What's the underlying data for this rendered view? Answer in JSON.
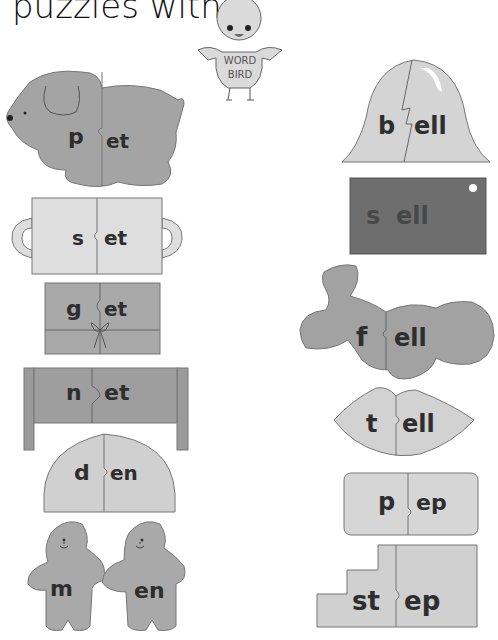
{
  "page": {
    "title": "puzzles with",
    "mascot": {
      "line1": "WORD",
      "line2": "BIRD"
    }
  },
  "colors": {
    "background": "#ffffff",
    "outline": "#777777",
    "light_gray": "#d6d6d6",
    "mid_gray": "#a9a9a9",
    "dark_gray": "#8a8a8a",
    "darkest_gray": "#6f6f6f",
    "letter": "#2e2e2e"
  },
  "puzzles_left": [
    {
      "shape": "dog",
      "first": "p",
      "rest": "et"
    },
    {
      "shape": "mug",
      "first": "s",
      "rest": "et"
    },
    {
      "shape": "gift",
      "first": "g",
      "rest": "et"
    },
    {
      "shape": "bed",
      "first": "n",
      "rest": "et"
    },
    {
      "shape": "dome",
      "first": "d",
      "rest": "en"
    },
    {
      "shape": "people",
      "first": "m",
      "rest": "en"
    }
  ],
  "puzzles_right": [
    {
      "shape": "bell",
      "first": "b",
      "rest": "ell"
    },
    {
      "shape": "tag",
      "first": "s",
      "rest": "ell"
    },
    {
      "shape": "fell-blob",
      "first": "f",
      "rest": "ell"
    },
    {
      "shape": "lips",
      "first": "t",
      "rest": "ell"
    },
    {
      "shape": "rounded-rect",
      "first": "p",
      "rest": "ep"
    },
    {
      "shape": "stairs",
      "first": "st",
      "rest": "ep"
    }
  ]
}
